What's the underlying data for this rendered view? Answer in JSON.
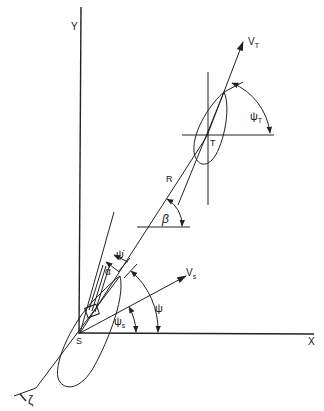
{
  "diagram": {
    "colors": {
      "ink": "#222222",
      "background": "#ffffff"
    },
    "axes": {
      "x_label": "X",
      "y_label": "Y"
    },
    "points": {
      "ship": "S",
      "target": "T"
    },
    "labels": {
      "target_velocity": "V",
      "target_velocity_sub": "T",
      "ship_velocity": "V",
      "ship_velocity_sub": "s",
      "range": "R",
      "los_angle": "β",
      "target_heading": "ψ",
      "target_heading_sub": "T",
      "ship_heading": "ψ",
      "ship_heading_sub": "s",
      "heading": "ψ",
      "turn_rate": "ψ̇",
      "rudder_angle": "α",
      "wake": "ζ"
    }
  }
}
